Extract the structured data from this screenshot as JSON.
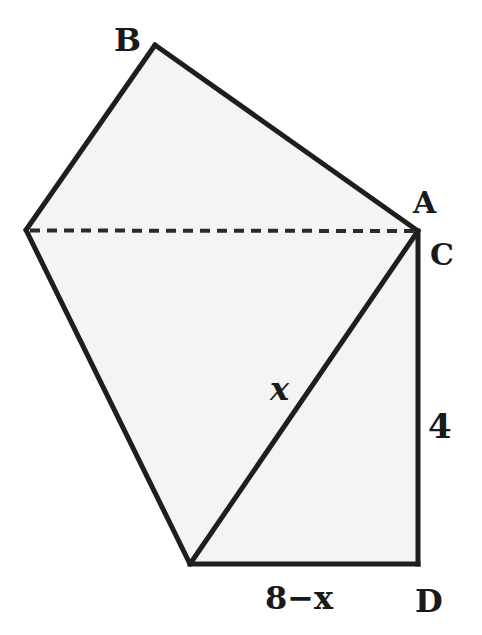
{
  "diagram": {
    "type": "geometry-figure",
    "colors": {
      "fill": "#f4f4f4",
      "stroke": "#1e1e1e",
      "text": "#1a1a1a",
      "background": "#ffffff"
    },
    "vertices": {
      "B": {
        "label": "B",
        "x": 155,
        "y": 45
      },
      "L": {
        "label": "",
        "x": 26,
        "y": 230
      },
      "AC": {
        "x": 418,
        "y": 231
      },
      "E": {
        "label": "",
        "x": 190,
        "y": 564
      },
      "D": {
        "label": "D",
        "x": 418,
        "y": 564
      }
    },
    "labels": {
      "B": "B",
      "A": "A",
      "C": "C",
      "D": "D",
      "hypotenuse": "x",
      "side_vertical": "4",
      "side_bottom": "8−x"
    },
    "segments": [
      {
        "from": "L",
        "to": "B",
        "style": "solid"
      },
      {
        "from": "B",
        "to": "AC",
        "style": "solid"
      },
      {
        "from": "L",
        "to": "AC",
        "style": "dashed"
      },
      {
        "from": "L",
        "to": "E",
        "style": "solid"
      },
      {
        "from": "E",
        "to": "AC",
        "style": "solid",
        "length_label": "x"
      },
      {
        "from": "AC",
        "to": "D",
        "style": "solid",
        "length_label": "4"
      },
      {
        "from": "E",
        "to": "D",
        "style": "solid",
        "length_label": "8−x"
      }
    ]
  }
}
